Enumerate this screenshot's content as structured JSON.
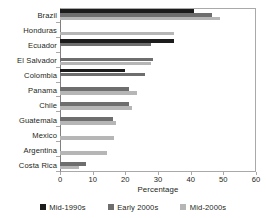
{
  "chart_data": {
    "type": "bar",
    "orientation": "horizontal",
    "title": "",
    "xlabel": "Percentage",
    "ylabel": "",
    "xlim": [
      0,
      60
    ],
    "xticks": [
      0,
      10,
      20,
      30,
      40,
      50,
      60
    ],
    "grid": false,
    "legend_position": "bottom",
    "categories": [
      "Brazil",
      "Honduras",
      "Ecuador",
      "El Salvador",
      "Colombia",
      "Panama",
      "Chile",
      "Guatemala",
      "Mexico",
      "Argentina",
      "Costa Rica"
    ],
    "series": [
      {
        "name": "Mid-1990s",
        "color": "#1c1c1c",
        "values": [
          41,
          null,
          35,
          null,
          20,
          null,
          null,
          null,
          null,
          null,
          null
        ]
      },
      {
        "name": "Early 2000s",
        "color": "#6e6e6e",
        "values": [
          46.5,
          null,
          28,
          28.5,
          26,
          21,
          21,
          16.2,
          null,
          null,
          8
        ]
      },
      {
        "name": "Mid-2000s",
        "color": "#b6b6b6",
        "values": [
          49,
          35,
          null,
          28,
          null,
          23.5,
          22,
          17,
          16.5,
          14.5,
          5.8
        ]
      }
    ]
  },
  "legend": {
    "items": [
      {
        "label": "Mid-1990s",
        "color": "#1c1c1c"
      },
      {
        "label": "Early 2000s",
        "color": "#6e6e6e"
      },
      {
        "label": "Mid-2000s",
        "color": "#b6b6b6"
      }
    ]
  },
  "axis": {
    "x_title": "Percentage",
    "x_tick_labels": [
      "0",
      "10",
      "20",
      "30",
      "40",
      "50",
      "60"
    ]
  }
}
